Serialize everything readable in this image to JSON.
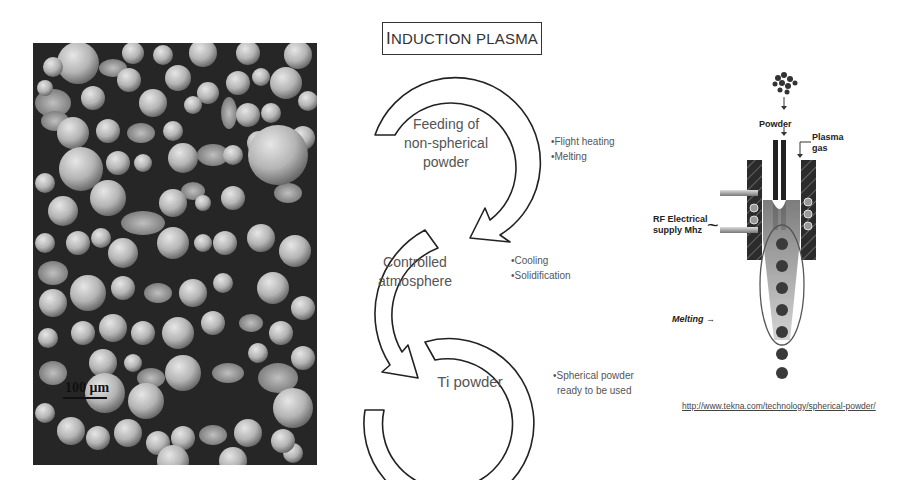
{
  "micrograph": {
    "scale_label": "100 μm"
  },
  "diagram": {
    "title_first": "I",
    "title_rest": "NDUCTION PLASMA",
    "stages": [
      {
        "lines": [
          "Feeding of",
          "non-spherical",
          "powder"
        ],
        "bullets": [
          "•Flight heating",
          "•Melting"
        ]
      },
      {
        "lines": [
          "Controlled",
          "atmosphere"
        ],
        "bullets": [
          "•Cooling",
          "•Solidification"
        ]
      },
      {
        "lines": [
          "Ti powder"
        ],
        "bullets": [
          "•Spherical powder",
          "ready to be used"
        ]
      }
    ]
  },
  "torch": {
    "powder_label": "Powder",
    "plasma_gas_label_1": "Plasma",
    "plasma_gas_label_2": "gas",
    "rf_label_1": "RF Electrical",
    "rf_label_2": "supply Mhz",
    "melting_label": "Melting →",
    "wave_icon": "~",
    "source_url": "http://www.tekna.com/technology/spherical-powder/"
  },
  "colors": {
    "background": "#ffffff",
    "outline": "#222222",
    "text": "#555555",
    "coil_block": "#2b2b2b",
    "plasma": "#8a8a8a"
  }
}
